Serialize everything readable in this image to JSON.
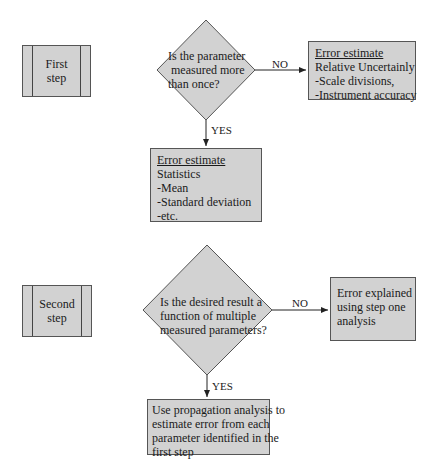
{
  "steps": [
    {
      "label_line1": "First",
      "label_line2": "step"
    },
    {
      "label_line1": "Second",
      "label_line2": "step"
    }
  ],
  "decisions": [
    {
      "lines": [
        "Is the parameter",
        "measured more",
        "than once?"
      ],
      "no_label": "NO",
      "yes_label": "YES"
    },
    {
      "lines": [
        "Is the desired result a",
        "function of multiple",
        "measured parameters?"
      ],
      "no_label": "NO",
      "yes_label": "YES"
    }
  ],
  "boxes": {
    "step1_no": {
      "title": "Error estimate",
      "lines": [
        "Relative Uncertainly",
        "-Scale divisions,",
        "-Instrument accuracy"
      ]
    },
    "step1_yes": {
      "title": "Error estimate",
      "lines": [
        "Statistics",
        "-Mean",
        "-Standard deviation",
        "-etc."
      ]
    },
    "step2_no": {
      "lines": [
        "Error explained",
        "using step one",
        "analysis"
      ]
    },
    "step2_yes": {
      "lines": [
        "Use propagation analysis to",
        "estimate error from each",
        "parameter identified in the",
        "first step"
      ]
    }
  },
  "colors": {
    "fill": "#d2d2d2",
    "stroke": "#555555",
    "line": "#222222"
  }
}
